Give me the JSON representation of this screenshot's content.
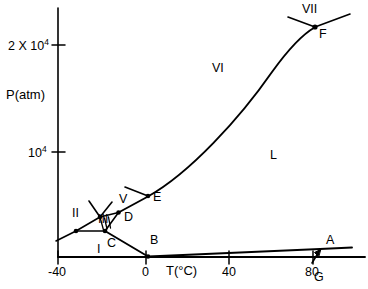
{
  "figure": {
    "kind": "phase-diagram",
    "background": "#ffffff",
    "line_color": "#000000"
  },
  "axes": {
    "y_axis_label": "P(atm)",
    "x_axis_label": "T(°C)",
    "y_ticks": [
      {
        "label_base": "2 X 10",
        "label_exp": "4",
        "value": 20000,
        "y_px": 45
      },
      {
        "label_base": "10",
        "label_exp": "4",
        "value": 10000,
        "y_px": 152
      }
    ],
    "x_ticks": [
      {
        "label": "-40",
        "value": -40,
        "x_px": 58
      },
      {
        "label": "0",
        "value": 0,
        "x_px": 146
      },
      {
        "label": "40",
        "value": 40,
        "x_px": 229
      },
      {
        "label": "80",
        "value": 80,
        "x_px": 313
      }
    ],
    "x_range": [
      -40,
      100
    ],
    "y_range": [
      0,
      26000
    ],
    "grid": false
  },
  "regions": [
    {
      "name": "I",
      "label": "I",
      "x_px": 97,
      "y_px": 243
    },
    {
      "name": "II",
      "label": "II",
      "x_px": 72,
      "y_px": 207
    },
    {
      "name": "III",
      "label": "III",
      "x_px": 98,
      "y_px": 213
    },
    {
      "name": "V",
      "label": "V",
      "x_px": 119,
      "y_px": 193
    },
    {
      "name": "VI",
      "label": "VI",
      "x_px": 212,
      "y_px": 62
    },
    {
      "name": "VII",
      "label": "VII",
      "x_px": 302,
      "y_px": 4
    },
    {
      "name": "L",
      "label": "L",
      "x_px": 270,
      "y_px": 149
    }
  ],
  "points": [
    {
      "name": "A",
      "label": "A",
      "x_px": 320,
      "y_px": 249,
      "label_x": 326,
      "label_y": 235,
      "dot": false
    },
    {
      "name": "B",
      "label": "B",
      "x_px": 148,
      "y_px": 257,
      "label_x": 150,
      "label_y": 235,
      "dot": true
    },
    {
      "name": "C",
      "label": "C",
      "x_px": 105,
      "y_px": 231,
      "label_x": 107,
      "label_y": 238,
      "dot": true
    },
    {
      "name": "D",
      "label": "D",
      "x_px": 119,
      "y_px": 212,
      "label_x": 124,
      "label_y": 213,
      "dot": true
    },
    {
      "name": "E",
      "label": "E",
      "x_px": 148,
      "y_px": 196,
      "label_x": 153,
      "label_y": 192,
      "dot": true
    },
    {
      "name": "F",
      "label": "F",
      "x_px": 315,
      "y_px": 27,
      "label_x": 319,
      "label_y": 29,
      "dot": true
    },
    {
      "name": "G",
      "label": "G",
      "x_px": 318,
      "y_px": 250,
      "label_x": 316,
      "label_y": 272,
      "dot": false
    }
  ],
  "curves": {
    "liquid_vapor_B_to_A": "B(0°C) rising gently to A near 85°C",
    "melting_D_E_F": "ice-liquid boundary from D through E curving up to triple point F",
    "ice_I_boundary": "C to B falling line",
    "ice_I_II_III": "small polygon of ice I / II / III triple points near -35 to -20 °C"
  }
}
